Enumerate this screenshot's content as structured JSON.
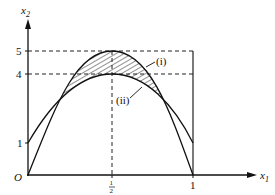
{
  "diagram": {
    "axes": {
      "x_label": "x",
      "x_label_sub": "1",
      "y_label": "x",
      "y_label_sub": "2",
      "origin_label": "O"
    },
    "x_ticks": [
      {
        "label": "1/2",
        "num": "1",
        "den": "2",
        "value": 0.5
      },
      {
        "label": "1",
        "value": 1
      }
    ],
    "y_ticks": [
      {
        "label": "5",
        "value": 5
      },
      {
        "label": "4",
        "value": 4
      },
      {
        "label": "1",
        "value": 1
      }
    ],
    "curves": [
      {
        "id": "i",
        "label": "(i)",
        "description": "outer curve from (0,0) through peak (1/2,5) to (1,0)"
      },
      {
        "id": "ii",
        "label": "(ii)",
        "description": "inner curve from (0,1) through peak (1/2,4) to (1,1)"
      }
    ],
    "shaded_region": "hatched area between curve (i) and curve (ii)",
    "guides": [
      "dashed horizontal line at x2=5",
      "dashed horizontal line at x2=4",
      "dashed vertical line at x1=1/2",
      "solid vertical line at x1=1"
    ]
  }
}
